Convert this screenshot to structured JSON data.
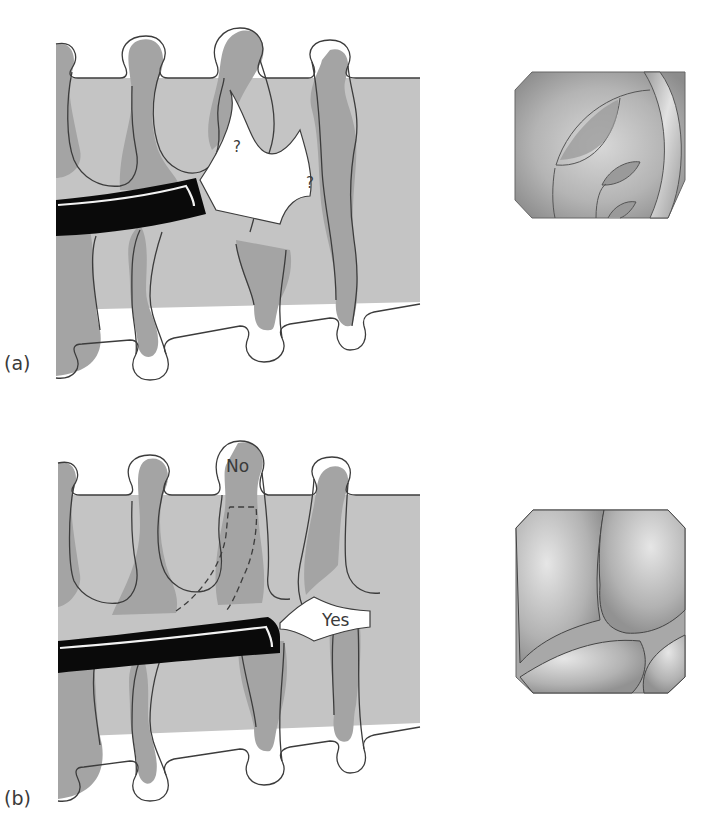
{
  "figure": {
    "panels": [
      {
        "id": "a",
        "label": "(a)",
        "annotations": [
          "?",
          "?"
        ],
        "endoscopic_view": "lumen with folds, view obstructed"
      },
      {
        "id": "b",
        "label": "(b)",
        "annotations": [
          "No",
          "Yes"
        ],
        "endoscopic_view": "converging folds with central lumen gap"
      }
    ]
  },
  "colors": {
    "mucosa_light": "#c4c4c4",
    "mucosa_dark": "#a4a4a4",
    "outline": "#3c3c3c",
    "endoscope": "#0a0a0a",
    "lumen": "#ffffff"
  }
}
